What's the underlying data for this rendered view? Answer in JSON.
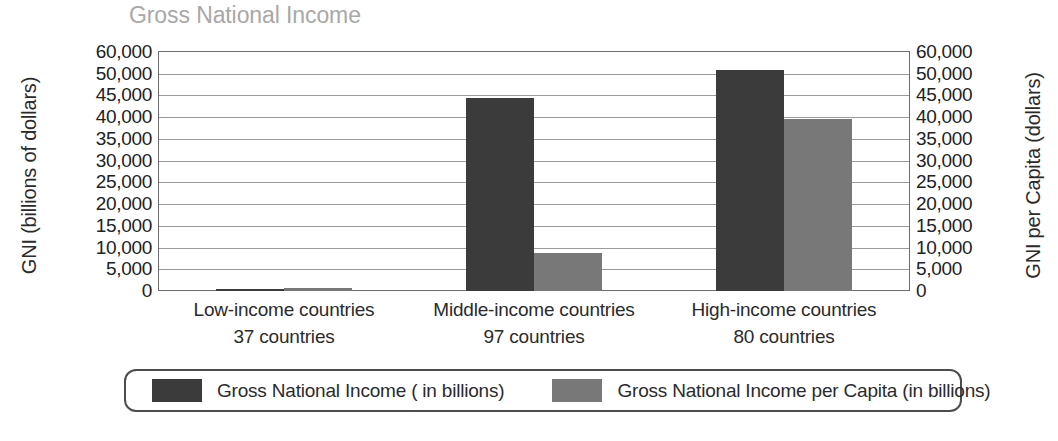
{
  "chart_data": {
    "type": "bar",
    "title": "Gross National Income",
    "xlabel": "",
    "ylabel": "GNI (billions of dollars)",
    "y2label": "GNI per Capita (dollars)",
    "grid": true,
    "legend_position": "bottom",
    "categories": [
      "Low-income countries",
      "Middle-income countries",
      "High-income countries"
    ],
    "category_sublabels": [
      "37 countries",
      "97 countries",
      "80 countries"
    ],
    "tick_labels": [
      "60,000",
      "50,000",
      "45,000",
      "40,000",
      "35,000",
      "30,000",
      "25,000",
      "20,000",
      "15,000",
      "10,000",
      "5,000",
      "0"
    ],
    "tick_values": [
      60000,
      50000,
      45000,
      40000,
      35000,
      30000,
      25000,
      20000,
      15000,
      10000,
      5000,
      0
    ],
    "ylim": [
      0,
      60000
    ],
    "y2lim": [
      0,
      60000
    ],
    "series": [
      {
        "name": "Gross National Income ( in billions)",
        "color": "#3b3b3b",
        "values": [
          400,
          44500,
          51500
        ]
      },
      {
        "name": "Gross National Income per Capita (in billions)",
        "color": "#787878",
        "values": [
          600,
          8800,
          39500
        ]
      }
    ]
  },
  "legend": {
    "entries": [
      {
        "label": "Gross National Income ( in billions)",
        "color": "#3b3b3b"
      },
      {
        "label": "Gross National Income per Capita (in billions)",
        "color": "#787878"
      }
    ]
  }
}
